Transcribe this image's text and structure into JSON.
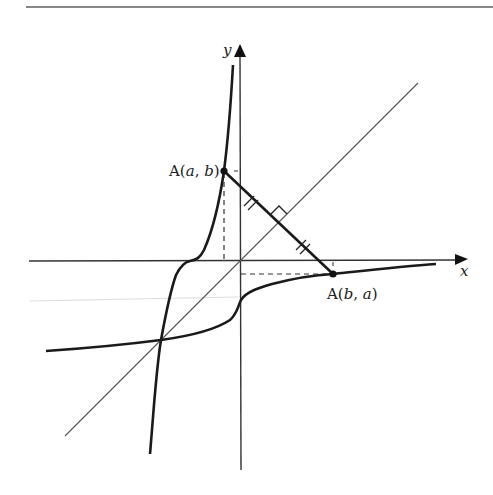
{
  "figure": {
    "axes": {
      "x_label": "x",
      "y_label": "y"
    },
    "points": [
      {
        "id": "A1",
        "label_prefix": "A(",
        "coord1": "a",
        "sep": ", ",
        "coord2": "b",
        "label_suffix": ")"
      },
      {
        "id": "A2",
        "label_prefix": "A(",
        "coord1": "b",
        "sep": ", ",
        "coord2": "a",
        "label_suffix": ")"
      }
    ],
    "annotations": {
      "equal_length_marks": "double tick marks on both halves of segment",
      "right_angle_mark": "segment perpendicular to y = x"
    },
    "colors": {
      "curve": "#1a1a1a",
      "axis": "#333333",
      "mirror_line": "#555555",
      "dashed": "#333333",
      "top_rule": "#888888"
    }
  }
}
